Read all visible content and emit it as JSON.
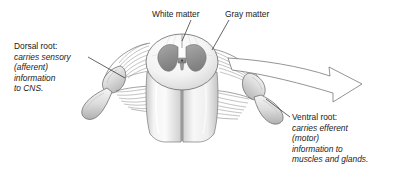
{
  "figure": {
    "background_color": "#ffffff",
    "text_color": "#1a1a1a",
    "gray_matter_color": "#989898",
    "white_matter_color": "#f2f2f2",
    "outline_color": "#555555",
    "leader_color": "#222222"
  },
  "labels": {
    "white_matter": "White matter",
    "gray_matter": "Gray matter",
    "dorsal_root": {
      "head": "Dorsal root:",
      "lines": [
        "carries sensory",
        "(afferent)",
        "information",
        "to CNS."
      ]
    },
    "ventral_root": {
      "head": "Ventral root:",
      "lines": [
        "carries efferent",
        "(motor)",
        "information to",
        "muscles and glands."
      ]
    }
  }
}
